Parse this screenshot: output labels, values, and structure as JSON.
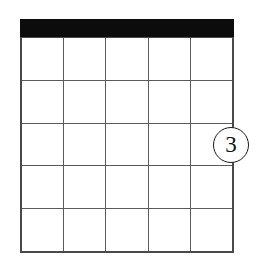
{
  "figure": {
    "background_color": "#ffffff",
    "width": 259,
    "height": 258
  },
  "grid": {
    "name": "blank-calendar-grid",
    "columns": 5,
    "rows": 5,
    "line_color": "#5a5a5a",
    "border_color": "#4a4a4a",
    "cell_fill": "#ffffff",
    "header_bar": {
      "color": "#0c0c0c",
      "label": ""
    },
    "cells": [
      [
        "",
        "",
        "",
        "",
        ""
      ],
      [
        "",
        "",
        "",
        "",
        ""
      ],
      [
        "",
        "",
        "",
        "",
        ""
      ],
      [
        "",
        "",
        "",
        "",
        ""
      ],
      [
        "",
        "",
        "",
        "",
        ""
      ]
    ]
  },
  "annotations": [
    {
      "name": "callout-3",
      "label": "3",
      "shape": "circle",
      "color": "#111111",
      "border_color": "#1a1a1a",
      "fill": "#ffffff",
      "x": 213,
      "y": 127,
      "size": 36
    }
  ]
}
